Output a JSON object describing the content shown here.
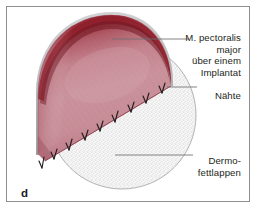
{
  "figure": {
    "panel_letter": "d",
    "frame_color": "#8e8e90",
    "background_color": "#ffffff"
  },
  "labels": {
    "muscle": {
      "name": "m-pectoralis-major",
      "lines": [
        "M. pectoralis",
        "major",
        "über einem",
        "Implantat"
      ],
      "text_color": "#231f20"
    },
    "sutures": {
      "name": "naehte",
      "lines": [
        "Nähte"
      ],
      "text_color": "#231f20"
    },
    "fat_flap": {
      "name": "dermo-fettlappen",
      "lines": [
        "Dermo-",
        "fettlappen"
      ],
      "text_color": "#231f20"
    }
  },
  "anatomy": {
    "muscle_flap": {
      "name": "pectoralis-major-muscle-flap",
      "rim_color": "#8e1f2b",
      "body_color_light": "#cfa0a8",
      "body_color_mid": "#c08e99",
      "body_color_deep": "#a8606f",
      "cut_edge_color": "#b9b9bb",
      "striation_color": "#a8737f"
    },
    "dermo_fat_flap": {
      "name": "dermo-fat-flap",
      "fill_color": "#f4f4f4",
      "speckle_color": "#bfbfc2",
      "outline_color": "#a9a9ad"
    },
    "sutures": {
      "name": "suture-stitches",
      "color": "#231f20",
      "count": 9
    },
    "leader_lines": {
      "color": "#6e6e72"
    }
  }
}
